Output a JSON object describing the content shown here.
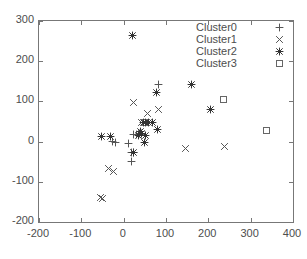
{
  "chart_data": {
    "type": "scatter",
    "title": "",
    "xlabel": "",
    "ylabel": "",
    "xlim": [
      -200,
      400
    ],
    "ylim": [
      -200,
      300
    ],
    "xticks": [
      -200,
      -100,
      0,
      100,
      200,
      300,
      400
    ],
    "yticks": [
      -200,
      -100,
      0,
      100,
      200,
      300
    ],
    "xtick_labels": [
      "-200",
      "-100",
      "0",
      "100",
      "200",
      "300",
      "400"
    ],
    "ytick_labels": [
      "-200",
      "-100",
      "0",
      "100",
      "200",
      "300"
    ],
    "grid": false,
    "legend_position": "top-right",
    "series": [
      {
        "name": "Cluster0",
        "marker": "plus",
        "color": "#555555",
        "points": [
          [
            81,
            143
          ],
          [
            -27,
            2
          ],
          [
            -21,
            0
          ],
          [
            21,
            20
          ],
          [
            18,
            -25
          ],
          [
            21,
            -27
          ],
          [
            17,
            -48
          ],
          [
            30,
            18
          ],
          [
            36,
            22
          ],
          [
            10,
            -4
          ]
        ]
      },
      {
        "name": "Cluster1",
        "marker": "cross",
        "color": "#555555",
        "points": [
          [
            22,
            99
          ],
          [
            81,
            80
          ],
          [
            55,
            72
          ],
          [
            146,
            -16
          ],
          [
            238,
            -11
          ],
          [
            -36,
            -65
          ],
          [
            -25,
            -72
          ],
          [
            -55,
            -138
          ],
          [
            -51,
            -140
          ],
          [
            42,
            49
          ],
          [
            47,
            50
          ]
        ]
      },
      {
        "name": "Cluster2",
        "marker": "asterisk",
        "color": "#333333",
        "points": [
          [
            20,
            264
          ],
          [
            159,
            143
          ],
          [
            203,
            82
          ],
          [
            77,
            123
          ],
          [
            45,
            49
          ],
          [
            50,
            48
          ],
          [
            57,
            49
          ],
          [
            66,
            49
          ],
          [
            40,
            22
          ],
          [
            38,
            26
          ],
          [
            34,
            17
          ],
          [
            49,
            0
          ],
          [
            78,
            31
          ],
          [
            -33,
            14
          ],
          [
            -53,
            13
          ],
          [
            51,
            16
          ],
          [
            21,
            -26
          ]
        ]
      },
      {
        "name": "Cluster3",
        "marker": "square",
        "color": "#666666",
        "points": [
          [
            235,
            105
          ],
          [
            337,
            28
          ]
        ]
      }
    ]
  },
  "legend": {
    "entries": [
      {
        "label": "Cluster0",
        "marker": "plus"
      },
      {
        "label": "Cluster1",
        "marker": "cross"
      },
      {
        "label": "Cluster2",
        "marker": "asterisk"
      },
      {
        "label": "Cluster3",
        "marker": "square"
      }
    ]
  },
  "axis": {
    "frame_color": "#777777",
    "tick_color": "#777777",
    "label_color": "#4d4d4d"
  }
}
